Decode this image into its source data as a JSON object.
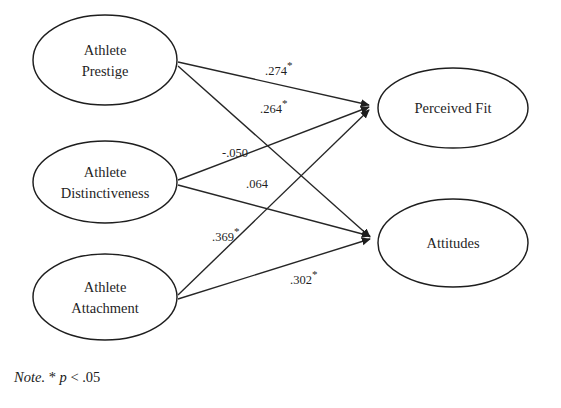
{
  "figure": {
    "type": "path-diagram",
    "nodes": [
      {
        "id": "prestige",
        "label_line1": "Athlete",
        "label_line2": "Prestige",
        "cx": 105,
        "cy": 60,
        "rx": 72,
        "ry": 45
      },
      {
        "id": "distinctiveness",
        "label_line1": "Athlete",
        "label_line2": "Distinctiveness",
        "cx": 105,
        "cy": 182,
        "rx": 72,
        "ry": 41
      },
      {
        "id": "attachment",
        "label_line1": "Athlete",
        "label_line2": "Attachment",
        "cx": 105,
        "cy": 297,
        "rx": 72,
        "ry": 43
      },
      {
        "id": "perceived_fit",
        "label_line1": "Perceived Fit",
        "label_line2": "",
        "cx": 453,
        "cy": 108,
        "rx": 75,
        "ry": 40
      },
      {
        "id": "attitudes",
        "label_line1": "Attitudes",
        "label_line2": "",
        "cx": 453,
        "cy": 243,
        "rx": 75,
        "ry": 44
      }
    ],
    "paths": [
      {
        "from": "prestige",
        "to": "perceived_fit",
        "coefficient": ".274",
        "significant": true,
        "star": "*",
        "label_x": 265,
        "label_y": 75,
        "x1": 178,
        "y1": 62,
        "x2": 371,
        "y2": 105
      },
      {
        "from": "prestige",
        "to": "attitudes",
        "coefficient": ".264",
        "significant": true,
        "star": "*",
        "label_x": 260,
        "label_y": 113,
        "x1": 178,
        "y1": 66,
        "x2": 372,
        "y2": 238
      },
      {
        "from": "distinctiveness",
        "to": "perceived_fit",
        "coefficient": "-.050",
        "significant": false,
        "star": "",
        "label_x": 222,
        "label_y": 157,
        "x1": 178,
        "y1": 180,
        "x2": 371,
        "y2": 107
      },
      {
        "from": "distinctiveness",
        "to": "attitudes",
        "coefficient": ".064",
        "significant": false,
        "star": "",
        "label_x": 246,
        "label_y": 188,
        "x1": 178,
        "y1": 185,
        "x2": 372,
        "y2": 236
      },
      {
        "from": "attachment",
        "to": "perceived_fit",
        "coefficient": ".369",
        "significant": true,
        "star": "*",
        "label_x": 212,
        "label_y": 241,
        "x1": 178,
        "y1": 295,
        "x2": 371,
        "y2": 109
      },
      {
        "from": "attachment",
        "to": "attitudes",
        "coefficient": ".302",
        "significant": true,
        "star": "*",
        "label_x": 290,
        "label_y": 284,
        "x1": 178,
        "y1": 299,
        "x2": 372,
        "y2": 240
      }
    ],
    "note": {
      "prefix": "Note.",
      "star": "*",
      "stat_symbol": "p",
      "comparison": "< .05"
    }
  }
}
